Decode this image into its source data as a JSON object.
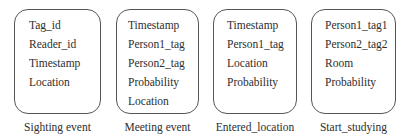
{
  "diagram": {
    "events": [
      {
        "caption": "Sighting event",
        "fields": [
          "Tag_id",
          "Reader_id",
          "Timestamp",
          "Location"
        ]
      },
      {
        "caption": "Meeting event",
        "fields": [
          "Timestamp",
          "Person1_tag",
          "Person2_tag",
          "Probability",
          "Location"
        ]
      },
      {
        "caption": "Entered_location",
        "fields": [
          "Timestamp",
          "Person1_tag",
          "Location",
          "Probability"
        ]
      },
      {
        "caption": "Start_studying",
        "fields": [
          "Person1_tag1",
          "Person2_tag2",
          "Room",
          "Probability"
        ]
      }
    ]
  }
}
